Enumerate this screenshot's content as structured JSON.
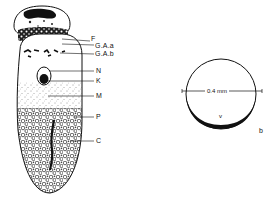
{
  "figure_left": {
    "labels": [
      {
        "key": "F",
        "text": "F",
        "x": 91,
        "y": 38
      },
      {
        "key": "GAa",
        "text": "G.A.a",
        "x": 95,
        "y": 42
      },
      {
        "key": "GAb",
        "text": "G.A.b",
        "x": 95,
        "y": 51
      },
      {
        "key": "N",
        "text": "N",
        "x": 95,
        "y": 68
      },
      {
        "key": "K",
        "text": "K",
        "x": 95,
        "y": 78
      },
      {
        "key": "M",
        "text": "M",
        "x": 95,
        "y": 93
      },
      {
        "key": "P",
        "text": "P",
        "x": 95,
        "y": 114
      },
      {
        "key": "C",
        "text": "C",
        "x": 95,
        "y": 138
      }
    ]
  },
  "figure_right": {
    "scale_label": "0.4 mm",
    "inner_label": "v",
    "corner_label": "b"
  },
  "colors": {
    "ink": "#111111",
    "background": "#ffffff"
  }
}
